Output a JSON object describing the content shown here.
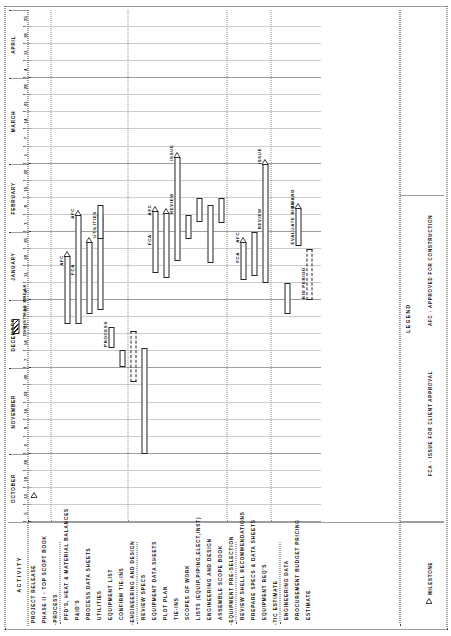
{
  "sheet": {
    "activity_header": "ACTIVITY",
    "legend_title": "LEGEND"
  },
  "timeline": {
    "months": [
      {
        "name": "OCTOBER",
        "weeks": [
          "5",
          "12",
          "19",
          "26"
        ]
      },
      {
        "name": "NOVEMBER",
        "weeks": [
          "2",
          "9",
          "16",
          "23",
          "30"
        ]
      },
      {
        "name": "DECEMBER",
        "weeks": [
          "7",
          "14",
          "21",
          "28"
        ]
      },
      {
        "name": "JANUARY",
        "weeks": [
          "4",
          "11",
          "18",
          "25"
        ]
      },
      {
        "name": "FEBRUARY",
        "weeks": [
          "1",
          "8",
          "15",
          "22"
        ]
      },
      {
        "name": "MARCH",
        "weeks": [
          "1",
          "7",
          "14",
          "21",
          "28"
        ]
      },
      {
        "name": "APRIL",
        "weeks": [
          "4",
          "11",
          "18",
          "25"
        ]
      }
    ]
  },
  "activities": [
    {
      "label": "PROJECT RELEASE",
      "style": "plain"
    },
    {
      "label": "PHASE II - TOP SCOPT BOOK",
      "style": "plain"
    },
    {
      "label": "-PROCESS",
      "style": "group"
    },
    {
      "label": "PFD'S, HEAT & MATERIAL BALANCES",
      "style": "sub"
    },
    {
      "label": "P&ID'S",
      "style": "sub"
    },
    {
      "label": "PROCESS DATA SHEETS",
      "style": "sub"
    },
    {
      "label": "UTILITIES",
      "style": "sub"
    },
    {
      "label": "EQUIPMENT LIST",
      "style": "sub"
    },
    {
      "label": "CONFIRM TIE-INS",
      "style": "sub"
    },
    {
      "label": "-ENGINEERING AND DESIGN",
      "style": "group"
    },
    {
      "label": "REVIEW SPECS",
      "style": "sub"
    },
    {
      "label": "EQUIPMENT DATA SHEETS",
      "style": "sub"
    },
    {
      "label": "PLOT PLAN",
      "style": "sub"
    },
    {
      "label": "TIE-INS",
      "style": "sub"
    },
    {
      "label": "SCOPES OF WORK",
      "style": "sub"
    },
    {
      "label": "LISTS (EQUIP,PIPING,ELECT,INST)",
      "style": "sub"
    },
    {
      "label": "ENGINEERING AND DESIGN",
      "style": "sub"
    },
    {
      "label": "ASSEMBLE SCOPE BOOK",
      "style": "sub"
    },
    {
      "label": "-EQUIPMENT PRE-SELECTION",
      "style": "group"
    },
    {
      "label": "REVIEW SHELL RECOMMENDATIONS",
      "style": "sub"
    },
    {
      "label": "PREPARE SPECS & DATA SHEETS",
      "style": "sub"
    },
    {
      "label": "EQUIPMENT REQ'S",
      "style": "sub"
    },
    {
      "label": "-TIC ESTIMATE",
      "style": "group"
    },
    {
      "label": "ENGINEERING DATA",
      "style": "sub"
    },
    {
      "label": "PROCUREMENT BUDGET PRICING",
      "style": "sub"
    },
    {
      "label": "ESTIMATE",
      "style": "sub"
    }
  ],
  "bars": [
    {
      "row": 3,
      "start": 11.6,
      "end": 15.6,
      "label": "AFC",
      "label_at": "end",
      "marker": "triangle",
      "kind": "solid"
    },
    {
      "row": 4,
      "start": 11.6,
      "end": 18.0,
      "label": "FCA",
      "label_at": "mid",
      "marker": "triangle-mid",
      "kind": "solid",
      "label2": "AFC",
      "label2_pos": 18.0
    },
    {
      "row": 5,
      "start": 12.2,
      "end": 16.4,
      "label": "",
      "label_at": "none",
      "marker": "triangle",
      "kind": "solid"
    },
    {
      "row": 6,
      "start": 12.4,
      "end": 18.0,
      "label": "",
      "label_at": "none",
      "marker": "triangle",
      "kind": "solid"
    },
    {
      "row": 6,
      "start": 16.6,
      "end": 18.6,
      "label": "UTILITIES",
      "label_at": "start",
      "marker": "none",
      "kind": "solid"
    },
    {
      "row": 7,
      "start": 10.2,
      "end": 11.4,
      "label": "PROCESS",
      "label_at": "start",
      "marker": "none",
      "kind": "solid"
    },
    {
      "row": 8,
      "start": 9.1,
      "end": 10.1,
      "label": "",
      "label_at": "none",
      "marker": "none",
      "kind": "solid"
    },
    {
      "row": 9,
      "start": 8.2,
      "end": 11.2,
      "label": "",
      "label_at": "none",
      "marker": "none",
      "kind": "dashed"
    },
    {
      "row": 10,
      "start": 4.0,
      "end": 10.2,
      "label": "",
      "label_at": "none",
      "marker": "none",
      "kind": "solid"
    },
    {
      "row": 11,
      "start": 14.6,
      "end": 18.2,
      "label": "FCA",
      "label_at": "mid",
      "marker": "triangle-mid",
      "kind": "solid",
      "label2": "AFC",
      "label2_pos": 18.2
    },
    {
      "row": 12,
      "start": 14.3,
      "end": 18.1,
      "label": "",
      "label_at": "none",
      "marker": "triangle",
      "kind": "solid"
    },
    {
      "row": 13,
      "start": 15.3,
      "end": 21.4,
      "label": "REVIEW",
      "label_at": "mid",
      "marker": "triangle-mid",
      "kind": "solid",
      "label2": "ISSUE",
      "label2_pos": 21.4
    },
    {
      "row": 14,
      "start": 16.6,
      "end": 18.0,
      "label": "",
      "label_at": "none",
      "marker": "none",
      "kind": "solid"
    },
    {
      "row": 15,
      "start": 17.6,
      "end": 19.0,
      "label": "",
      "label_at": "none",
      "marker": "none",
      "kind": "solid"
    },
    {
      "row": 16,
      "start": 15.2,
      "end": 18.6,
      "label": "",
      "label_at": "none",
      "marker": "none",
      "kind": "solid"
    },
    {
      "row": 17,
      "start": 17.5,
      "end": 19.0,
      "label": "",
      "label_at": "none",
      "marker": "none",
      "kind": "solid"
    },
    {
      "row": 19,
      "start": 14.2,
      "end": 16.4,
      "label": "FCA",
      "label_at": "mid",
      "marker": "triangle-mid",
      "kind": "solid",
      "label2": "AFC",
      "label2_pos": 16.6
    },
    {
      "row": 20,
      "start": 14.4,
      "end": 17.0,
      "label": "",
      "label_at": "none",
      "marker": "none",
      "kind": "solid"
    },
    {
      "row": 21,
      "start": 14.0,
      "end": 21.0,
      "label": "REVIEW",
      "label_at": "mid",
      "marker": "triangle-mid",
      "kind": "solid",
      "label2": "ISSUE",
      "label2_pos": 21.2
    },
    {
      "row": 23,
      "start": 12.2,
      "end": 14.0,
      "label": "",
      "label_at": "none",
      "marker": "none",
      "kind": "solid"
    },
    {
      "row": 24,
      "start": 16.2,
      "end": 18.4,
      "label": "EVALUATE BIDS",
      "label_at": "start",
      "marker": "triangle-mid",
      "kind": "solid",
      "label2": "AWARD",
      "label2_pos": 18.6
    },
    {
      "row": 25,
      "start": 13.0,
      "end": 16.0,
      "label": "BID PERIOD",
      "label_at": "start",
      "marker": "none",
      "kind": "dashed"
    }
  ],
  "milestones": [
    {
      "row": 0,
      "at": 1.4,
      "label": ""
    }
  ],
  "christmas": {
    "label": "CHRISTMAS BREAK",
    "start": 11.0,
    "end": 11.9
  },
  "legend": {
    "items": [
      {
        "icon": "milestone-triangle",
        "text": "MILESTONE"
      },
      {
        "icon": "none",
        "text": "FCA - ISSUE FOR CLIENT APPROVAL"
      },
      {
        "icon": "none",
        "text": "AFC - APPROVED FOR CONSTRUCTION"
      }
    ]
  },
  "colors": {
    "ink": "#1a1a1a",
    "grid": "#8a8a8a",
    "paper": "#ffffff"
  }
}
